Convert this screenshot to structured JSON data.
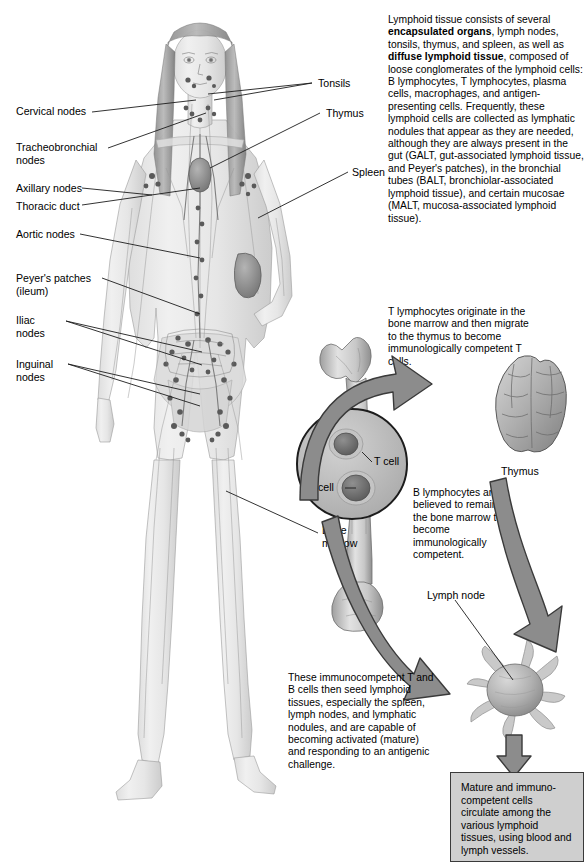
{
  "page": {
    "background_color": "#ffffff",
    "text_color": "#000000",
    "box_fill_color": "#cfcfcf",
    "box_border_color": "#3a3a3a",
    "arrow_fill_color": "#8c8c8c",
    "arrow_stroke_color": "#3a3a3a",
    "figure_tint_color": "#bdbdbd"
  },
  "intro_paragraph": {
    "segments": [
      {
        "text": "Lymphoid tissue consists of several ",
        "bold": false
      },
      {
        "text": "encapsulated organs",
        "bold": true
      },
      {
        "text": ", lymph nodes, tonsils, thymus, and spleen, as well as ",
        "bold": false
      },
      {
        "text": "diffuse lymphoid tissue",
        "bold": true
      },
      {
        "text": ", composed of loose conglomerates of the lymphoid cells: B lymphocytes, T lymphocytes, plasma cells, macrophages, and antigen-presenting cells. Frequently, these lymphoid cells are collected as lymphatic nodules that appear as they are needed, although they are always present in the gut (GALT, gut-associated lymphoid tissue, and Peyer's patches), in the bronchial tubes (BALT, bronchiolar-associated lymphoid tissue), and certain mucosae (MALT, mucosa-associated lymphoid tissue).",
        "bold": false
      }
    ]
  },
  "body_labels_left": [
    {
      "id": "cervical-nodes",
      "text": "Cervical nodes"
    },
    {
      "id": "tracheobronchial-nodes",
      "text": "Tracheobronchial\nnodes"
    },
    {
      "id": "axillary-nodes",
      "text": "Axillary nodes"
    },
    {
      "id": "thoracic-duct",
      "text": "Thoracic duct"
    },
    {
      "id": "aortic-nodes",
      "text": "Aortic nodes"
    },
    {
      "id": "peyers-patches",
      "text": "Peyer's patches\n(ileum)"
    },
    {
      "id": "iliac-nodes",
      "text": "Iliac\nnodes"
    },
    {
      "id": "inguinal-nodes",
      "text": "Inguinal\nnodes"
    }
  ],
  "body_labels_right": [
    {
      "id": "tonsils",
      "text": "Tonsils"
    },
    {
      "id": "thymus-body",
      "text": "Thymus"
    },
    {
      "id": "spleen",
      "text": "Spleen"
    }
  ],
  "marrow_section": {
    "bone_marrow_label": "Bone\nmarrow",
    "t_cell_label": "T cell",
    "b_cell_label": "B cell"
  },
  "t_lymphocyte_paragraph": "T lymphocytes originate in the bone marrow and then migrate to the thymus to become immunologically competent T cells.",
  "b_lymphocyte_paragraph": "B lymphocytes are believed to remain in the bone marrow to become immunologically competent.",
  "thymus_caption": "Thymus",
  "lymph_node_caption": "Lymph node",
  "seed_paragraph": "These immunocompetent T and B cells then seed lymphoid tissues, especially the spleen, lymph nodes, and lymphatic nodules, and are capable of becoming activated (mature) and responding to an antigenic challenge.",
  "final_box_text": "Mature and immuno-competent cells circulate among the various lymphoid tissues, using blood and lymph vessels."
}
